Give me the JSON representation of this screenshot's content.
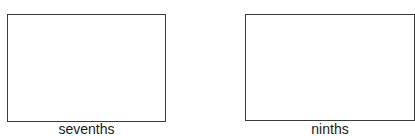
{
  "figures": [
    {
      "label": "sevenths"
    },
    {
      "label": "ninths"
    }
  ]
}
